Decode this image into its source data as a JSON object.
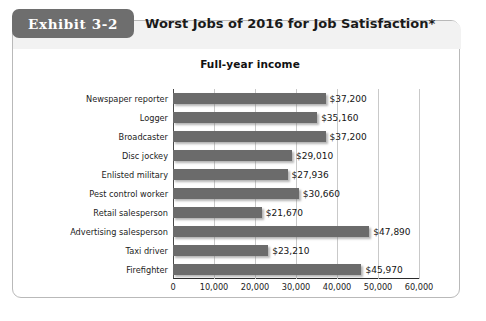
{
  "exhibit": {
    "badge_label": "Exhibit 3-2",
    "title": "Worst Jobs of 2016 for Job Satisfaction*"
  },
  "colors": {
    "badge_background": "#6e6e6e",
    "header_band": "#f2f2f2",
    "bar": "#6b6b6b",
    "gridline": "#c9c9c9",
    "axis": "#2a2a2a",
    "card_border": "#b9b9b9"
  },
  "chart_data": {
    "type": "bar",
    "orientation": "horizontal",
    "title": "Full-year income",
    "xlabel": "",
    "ylabel": "",
    "xlim": [
      0,
      60000
    ],
    "grid": true,
    "legend": "none",
    "xticks": [
      "0",
      "10,000",
      "20,000",
      "30,000",
      "40,000",
      "50,000",
      "60,000"
    ],
    "xtick_values": [
      0,
      10000,
      20000,
      30000,
      40000,
      50000,
      60000
    ],
    "categories": [
      "Newspaper reporter",
      "Logger",
      "Broadcaster",
      "Disc jockey",
      "Enlisted military",
      "Pest control worker",
      "Retail salesperson",
      "Advertising salesperson",
      "Taxi driver",
      "Firefighter"
    ],
    "values": [
      37200,
      35160,
      37200,
      29010,
      27936,
      30660,
      21670,
      47890,
      23210,
      45970
    ],
    "data_labels": [
      "$37,200",
      "$35,160",
      "$37,200",
      "$29,010",
      "$27,936",
      "$30,660",
      "$21,670",
      "$47,890",
      "$23,210",
      "$45,970"
    ]
  }
}
